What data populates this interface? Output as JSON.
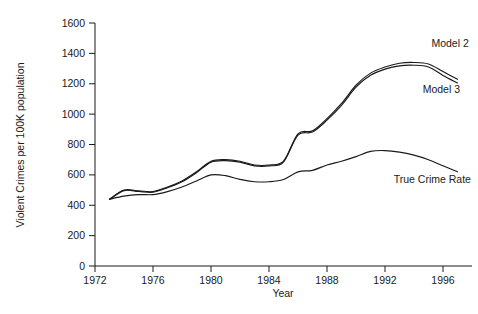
{
  "chart_data": {
    "type": "line",
    "title": "",
    "xlabel": "Year",
    "ylabel": "Violent Crimes per 100K population",
    "xlim": [
      1972,
      1998
    ],
    "ylim": [
      0,
      1600
    ],
    "xticks": [
      1972,
      1976,
      1980,
      1984,
      1988,
      1992,
      1996
    ],
    "yticks": [
      0,
      200,
      400,
      600,
      800,
      1000,
      1200,
      1400,
      1600
    ],
    "grid": false,
    "legend_position": "inline-annotations",
    "x": [
      1973,
      1974,
      1975,
      1976,
      1977,
      1978,
      1979,
      1980,
      1981,
      1982,
      1983,
      1984,
      1985,
      1986,
      1987,
      1988,
      1989,
      1990,
      1991,
      1992,
      1993,
      1994,
      1995,
      1996,
      1997
    ],
    "series": [
      {
        "name": "Model 2",
        "values": [
          440,
          500,
          495,
          490,
          520,
          560,
          620,
          690,
          700,
          690,
          665,
          665,
          690,
          870,
          890,
          970,
          1070,
          1190,
          1270,
          1310,
          1335,
          1340,
          1330,
          1280,
          1230
        ]
      },
      {
        "name": "Model 3",
        "values": [
          438,
          496,
          491,
          486,
          515,
          554,
          614,
          684,
          694,
          684,
          659,
          659,
          684,
          862,
          882,
          960,
          1058,
          1178,
          1256,
          1296,
          1318,
          1322,
          1310,
          1255,
          1205
        ]
      },
      {
        "name": "True Crime Rate",
        "values": [
          440,
          460,
          470,
          470,
          490,
          520,
          560,
          600,
          595,
          570,
          555,
          555,
          570,
          620,
          630,
          665,
          690,
          720,
          755,
          760,
          750,
          730,
          700,
          660,
          620
        ]
      }
    ],
    "annotations": [
      {
        "text": "Model 2",
        "x": 1995.2,
        "y": 1440
      },
      {
        "text": "Model 3",
        "x": 1994.6,
        "y": 1140
      },
      {
        "text": "True Crime Rate",
        "x": 1992.6,
        "y": 545
      }
    ]
  },
  "axis": {
    "ylabel": "Violent Crimes per 100K population",
    "xlabel": "Year",
    "yticks": [
      "0",
      "200",
      "400",
      "600",
      "800",
      "1000",
      "1200",
      "1400",
      "1600"
    ],
    "xticks": [
      "1972",
      "1976",
      "1980",
      "1984",
      "1988",
      "1992",
      "1996"
    ]
  },
  "colors": {
    "line": "#1a1a1a",
    "axis": "#1a1a1a",
    "background": "#ffffff"
  }
}
